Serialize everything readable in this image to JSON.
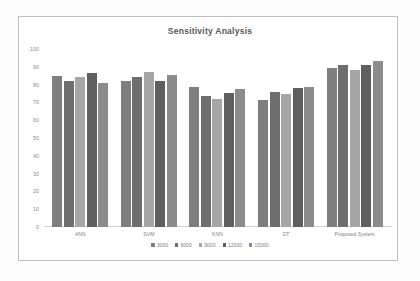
{
  "chart_data": {
    "type": "bar",
    "title": "Sensitivity Analysis",
    "xlabel": "",
    "ylabel": "",
    "ylim": [
      0,
      100
    ],
    "yticks": [
      "100",
      "90",
      "80",
      "70",
      "60",
      "50",
      "40",
      "30",
      "20",
      "10",
      "0"
    ],
    "grid": false,
    "legend_position": "bottom",
    "categories": [
      "ANN",
      "SVM",
      "KNN",
      "DT",
      "Proposed System"
    ],
    "series": [
      {
        "name": "3000",
        "color": "#7f7f7f",
        "values": [
          85,
          82,
          78.5,
          71.5,
          89.5
        ]
      },
      {
        "name": "6000",
        "color": "#6e6e6e",
        "values": [
          82,
          84.5,
          73.5,
          76,
          91
        ]
      },
      {
        "name": "9000",
        "color": "#a6a6a6",
        "values": [
          84.5,
          87,
          72,
          74.5,
          88
        ]
      },
      {
        "name": "12000",
        "color": "#5f5f5f",
        "values": [
          86.5,
          82,
          75.5,
          78,
          91
        ]
      },
      {
        "name": "15000",
        "color": "#8c8c8c",
        "values": [
          81,
          85.5,
          77.5,
          78.5,
          93
        ]
      }
    ]
  }
}
